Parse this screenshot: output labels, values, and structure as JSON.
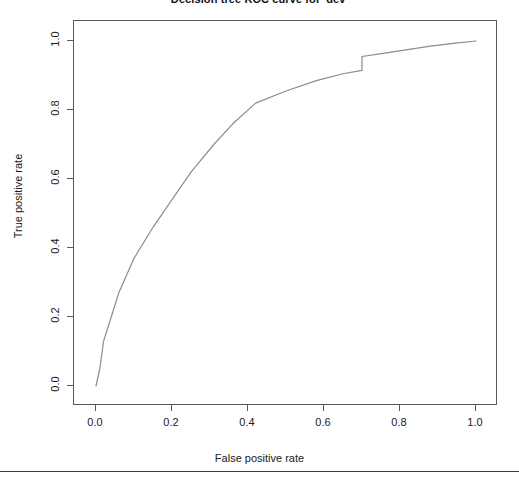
{
  "chart_data": {
    "type": "line",
    "title": "Decision tree ROC curve for 'dev'",
    "xlabel": "False positive rate",
    "ylabel": "True positive rate",
    "xlim": [
      0.0,
      1.0
    ],
    "ylim": [
      0.0,
      1.0
    ],
    "grid": false,
    "legend": null,
    "xticks": [
      "0.0",
      "0.2",
      "0.4",
      "0.6",
      "0.8",
      "1.0"
    ],
    "xtick_values": [
      0.0,
      0.2,
      0.4,
      0.6,
      0.8,
      1.0
    ],
    "yticks": [
      "0.0",
      "0.2",
      "0.4",
      "0.6",
      "0.8",
      "1.0"
    ],
    "ytick_values": [
      0.0,
      0.2,
      0.4,
      0.6,
      0.8,
      1.0
    ],
    "series": [
      {
        "name": "ROC curve",
        "color": "#8c8c8c",
        "x": [
          0.0,
          0.01,
          0.02,
          0.04,
          0.06,
          0.1,
          0.15,
          0.2,
          0.25,
          0.31,
          0.36,
          0.42,
          0.5,
          0.58,
          0.65,
          0.7,
          0.7,
          0.76,
          0.82,
          0.88,
          0.94,
          1.0
        ],
        "y": [
          0.0,
          0.05,
          0.13,
          0.2,
          0.27,
          0.37,
          0.46,
          0.54,
          0.62,
          0.7,
          0.76,
          0.82,
          0.855,
          0.885,
          0.905,
          0.915,
          0.955,
          0.965,
          0.975,
          0.985,
          0.993,
          1.0
        ]
      }
    ]
  }
}
